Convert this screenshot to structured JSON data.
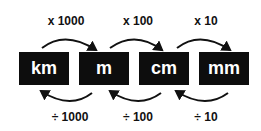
{
  "units": [
    "km",
    "m",
    "cm",
    "mm"
  ],
  "multiply_labels": [
    "x 1000",
    "x 100",
    "x 10"
  ],
  "divide_labels": [
    "÷ 1000",
    "÷ 100",
    "÷ 10"
  ],
  "colors": {
    "box": "#0d0d0d",
    "box_text": "#ffffff",
    "text": "#111111",
    "arrow": "#111111"
  }
}
